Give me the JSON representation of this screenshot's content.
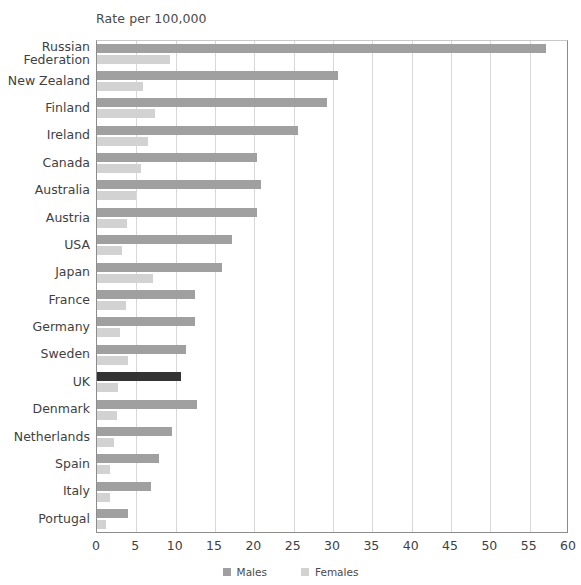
{
  "chart_data": {
    "type": "bar",
    "orientation": "horizontal",
    "title": "Rate per 100,000",
    "xlabel": "",
    "ylabel": "",
    "xlim": [
      0,
      60
    ],
    "xticks": [
      0,
      5,
      10,
      15,
      20,
      25,
      30,
      35,
      40,
      45,
      50,
      55,
      60
    ],
    "grid": "vertical",
    "legend_position": "bottom-center",
    "categories": [
      "Russian\nFederation",
      "New Zealand",
      "Finland",
      "Ireland",
      "Canada",
      "Australia",
      "Austria",
      "USA",
      "Japan",
      "France",
      "Germany",
      "Sweden",
      "UK",
      "Denmark",
      "Netherlands",
      "Spain",
      "Italy",
      "Portugal"
    ],
    "series": [
      {
        "name": "Males",
        "color": "#a0a0a0",
        "highlight_color": "#333333",
        "values": [
          57.1,
          30.6,
          29.2,
          25.5,
          20.3,
          20.8,
          20.4,
          17.2,
          15.9,
          12.4,
          12.4,
          11.3,
          10.7,
          12.7,
          9.5,
          7.9,
          6.9,
          3.9
        ]
      },
      {
        "name": "Females",
        "color": "#d2d2d2",
        "values": [
          9.3,
          5.8,
          7.4,
          6.5,
          5.6,
          4.9,
          3.8,
          3.2,
          7.1,
          3.7,
          2.9,
          4.0,
          2.7,
          2.6,
          2.1,
          1.6,
          1.6,
          1.1
        ]
      }
    ],
    "highlight_category": "UK",
    "legend": [
      {
        "label": "Males",
        "color": "#a0a0a0"
      },
      {
        "label": "Females",
        "color": "#d2d2d2"
      }
    ]
  }
}
